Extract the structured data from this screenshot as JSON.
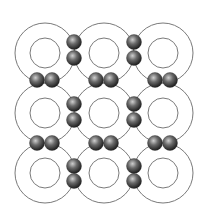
{
  "diagram": {
    "title": "",
    "type": "covalent-bond-lattice",
    "colors": {
      "background": "#ffffff",
      "ring_stroke": "#7a7a7a",
      "electron_dark": "#2a2a2a",
      "electron_light": "#bdbdbd"
    },
    "lattice": {
      "rows": 3,
      "cols": 3,
      "centers_x": [
        45,
        104,
        163
      ],
      "centers_y": [
        53,
        113,
        173
      ],
      "outer_radius": 30,
      "inner_radius": 15
    },
    "electron_radius": 7.5,
    "electron_pairs": {
      "horizontal": [
        {
          "y": 80,
          "x": [
            37,
            52
          ]
        },
        {
          "y": 80,
          "x": [
            96,
            111
          ]
        },
        {
          "y": 80,
          "x": [
            155,
            170
          ]
        },
        {
          "y": 143,
          "x": [
            37,
            52
          ]
        },
        {
          "y": 143,
          "x": [
            96,
            111
          ]
        },
        {
          "y": 143,
          "x": [
            155,
            170
          ]
        }
      ],
      "vertical": [
        {
          "x": 74,
          "y": [
            42,
            58
          ]
        },
        {
          "x": 134,
          "y": [
            42,
            58
          ]
        },
        {
          "x": 74,
          "y": [
            104,
            120
          ]
        },
        {
          "x": 134,
          "y": [
            104,
            120
          ]
        },
        {
          "x": 74,
          "y": [
            166,
            181
          ]
        },
        {
          "x": 134,
          "y": [
            166,
            181
          ]
        }
      ]
    }
  }
}
